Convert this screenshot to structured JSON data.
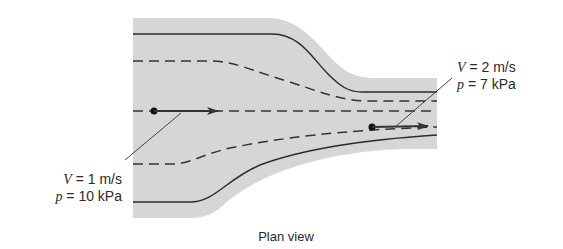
{
  "diagram": {
    "caption": "Plan view",
    "colors": {
      "fluid_region": "#d6d6d6",
      "wall_line": "#2b2b2b",
      "streamline": "#333333",
      "text": "#2a2a2a",
      "background": "#ffffff"
    },
    "inlet_label": {
      "velocity_symbol": "V",
      "velocity_value": " = 1 m/s",
      "pressure_symbol": "p",
      "pressure_value": " = 10 kPa"
    },
    "outlet_label": {
      "velocity_symbol": "V",
      "velocity_value": " = 2 m/s",
      "pressure_symbol": "p",
      "pressure_value": " = 7 kPa"
    }
  }
}
